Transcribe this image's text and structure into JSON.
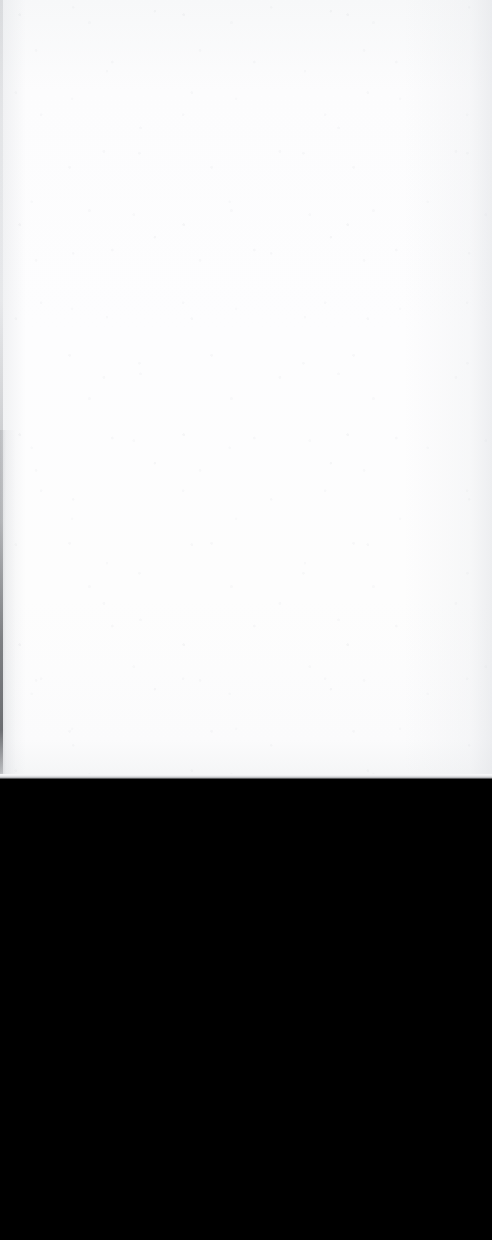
{
  "document": {
    "title": "Blank Scanned Page",
    "page_region": {
      "label": "Blank page surface",
      "content_text": "",
      "background_color": "#fdfdfd",
      "top_tone": "#f7f8f9",
      "bottom_tone": "#f4f5f6",
      "width_px": 492,
      "height_px": 778
    },
    "left_edge": {
      "label": "Page edge shadow",
      "color": "#4a4c50",
      "width_px": 3
    },
    "boundary": {
      "label": "Page to scanner-bed boundary",
      "y_px": 778,
      "line_color": "#c6c7ca"
    },
    "scanner_bed": {
      "label": "Empty scanner bed",
      "background_color": "#000000",
      "width_px": 492,
      "height_px": 461
    },
    "canvas": {
      "width_px": 492,
      "height_px": 1240,
      "background_color": "#000000"
    }
  }
}
